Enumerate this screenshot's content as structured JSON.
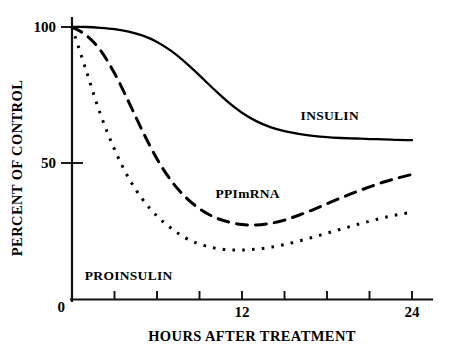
{
  "figure": {
    "background_color": "#ffffff",
    "ink_color": "#000000"
  },
  "chart_data": {
    "type": "line",
    "title": "",
    "subtitle": "",
    "xlabel": "HOURS AFTER TREATMENT",
    "ylabel": "PERCENT OF CONTROL",
    "xlim": [
      0,
      24
    ],
    "ylim": [
      0,
      100
    ],
    "grid": false,
    "legend_position": "inline-annotations",
    "x_ticks": [
      0,
      3,
      6,
      9,
      12,
      15,
      18,
      21,
      24
    ],
    "x_tick_labels": [
      "0",
      "",
      "",
      "",
      "12",
      "",
      "",
      "",
      "24"
    ],
    "y_ticks": [
      0,
      50,
      100
    ],
    "y_tick_labels": [
      "0",
      "50",
      "100"
    ],
    "x": [
      0,
      1,
      2,
      3,
      4,
      5,
      6,
      7,
      8,
      9,
      10,
      11,
      12,
      13,
      14,
      15,
      16,
      17,
      18,
      19,
      20,
      21,
      22,
      23,
      24
    ],
    "series": [
      {
        "name": "INSULIN",
        "style": "solid",
        "label_x": 18.2,
        "label_y": 66,
        "values": [
          100,
          100,
          99.7,
          99.2,
          98.3,
          96.8,
          94.5,
          91.2,
          87.0,
          82.2,
          77.2,
          72.5,
          68.5,
          65.4,
          63.2,
          61.7,
          60.7,
          60.0,
          59.5,
          59.2,
          59.0,
          58.8,
          58.7,
          58.5,
          58.4
        ]
      },
      {
        "name": "PPImRNA",
        "style": "dashed",
        "label_x": 12.4,
        "label_y": 37,
        "values": [
          100,
          97.0,
          91.5,
          83.0,
          72.5,
          61.5,
          51.5,
          43.5,
          37.5,
          33.2,
          30.2,
          28.4,
          27.4,
          27.2,
          27.8,
          29.0,
          30.8,
          32.8,
          35.0,
          37.2,
          39.3,
          41.2,
          43.0,
          44.5,
          45.8
        ]
      },
      {
        "name": "PROINSULIN",
        "style": "dotted",
        "label_x": 4.0,
        "label_y": 7,
        "values": [
          100,
          84.0,
          68.0,
          55.0,
          44.5,
          36.5,
          30.5,
          26.0,
          22.5,
          20.2,
          18.8,
          18.1,
          18.0,
          18.3,
          19.0,
          20.0,
          21.3,
          22.7,
          24.2,
          25.7,
          27.2,
          28.6,
          29.9,
          31.0,
          31.9
        ]
      }
    ]
  }
}
